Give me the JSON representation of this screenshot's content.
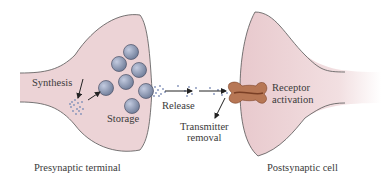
{
  "diagram": {
    "type": "synapse-transmission",
    "colors": {
      "cell_fill": "#ecd3d6",
      "cell_stroke": "#555555",
      "vesicle_fill": "#8a97b0",
      "vesicle_stroke": "#4a5066",
      "transmitter_dots": "#8090b8",
      "receptor_fill": "#b77755",
      "receptor_dark": "#7a3f25",
      "arrow": "#222222",
      "text": "#3a3a3a"
    },
    "labels": {
      "synthesis": "Synthesis",
      "storage": "Storage",
      "release": "Release",
      "transmitter_removal_line1": "Transmitter",
      "transmitter_removal_line2": "removal",
      "receptor_activation_line1": "Receptor",
      "receptor_activation_line2": "activation",
      "presynaptic": "Presynaptic terminal",
      "postsynaptic": "Postsynaptic cell"
    }
  }
}
